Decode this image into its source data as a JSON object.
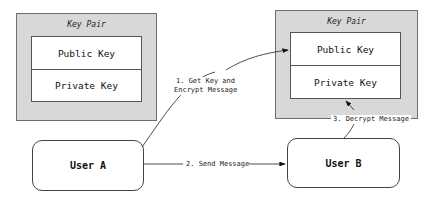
{
  "diagram": {
    "key_pair_left": {
      "title": "Key Pair",
      "public_key": "Public Key",
      "private_key": "Private Key"
    },
    "key_pair_right": {
      "title": "Key Pair",
      "public_key": "Public Key",
      "private_key": "Private Key"
    },
    "user_a": "User A",
    "user_b": "User B",
    "steps": {
      "step1_line1": "1. Get Key and",
      "step1_line2": "Encrypt Message",
      "step2": "2. Send Message",
      "step3": "3. Decrypt Message"
    },
    "colors": {
      "container_fill": "#d8d8d8",
      "border": "#555555",
      "background": "#ffffff"
    }
  }
}
